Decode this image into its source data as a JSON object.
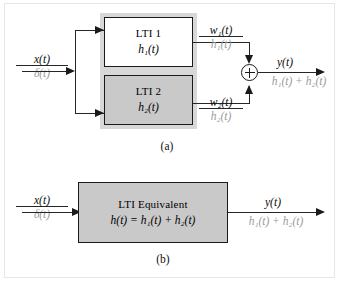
{
  "figure": {
    "background_color": "#ffffff",
    "border_color": "#e6e6e6",
    "panel_color": "#d8d8d8",
    "block_gray": "#c9c9c9",
    "wire_color": "#262626",
    "secondary_text_color": "#9a9a9a"
  },
  "diagram_a": {
    "caption": "(a)",
    "input": {
      "primary": "x(t)",
      "secondary": "δ(t)"
    },
    "blocks": [
      {
        "title": "LTI 1",
        "impulse_response": "h₁(t)",
        "fill": "white"
      },
      {
        "title": "LTI 2",
        "impulse_response": "h₂(t)",
        "fill": "gray"
      }
    ],
    "branch_labels": [
      {
        "primary": "w₁(t)",
        "secondary": "h₁(t)"
      },
      {
        "primary": "w₂(t)",
        "secondary": "h₂(t)"
      }
    ],
    "adder": {
      "symbol": "+",
      "name": "summing-junction"
    },
    "output": {
      "primary": "y(t)",
      "secondary": "h₁(t) + h₂(t)"
    }
  },
  "diagram_b": {
    "caption": "(b)",
    "input": {
      "primary": "x(t)",
      "secondary": "δ(t)"
    },
    "block": {
      "title": "LTI Equivalent",
      "equation": "h(t) = h₁(t) + h₂(t)",
      "fill": "gray"
    },
    "output": {
      "primary": "y(t)",
      "secondary": "h₁(t) + h₂(t)"
    }
  }
}
